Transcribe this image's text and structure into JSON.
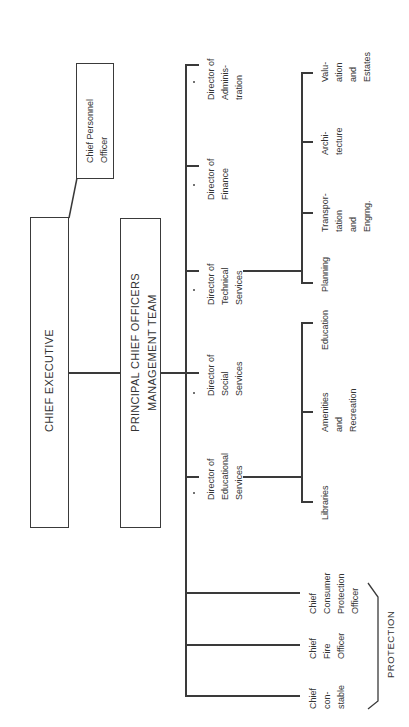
{
  "chart": {
    "orientation": "rotated-90-ccw",
    "top": {
      "chief_executive": "CHIEF EXECUTIVE",
      "chief_personnel_officer": "Chief Personnel\nOfficer",
      "management_team": "PRINCIPAL CHIEF OFFICERS\nMANAGEMENT TEAM"
    },
    "directors": [
      {
        "label": "Director of\nAdminis-\ntration",
        "marked": "*"
      },
      {
        "label": "Director of\nFinance",
        "marked": "*"
      },
      {
        "label": "Director of\nTechnical\nServices",
        "marked": "*"
      },
      {
        "label": "Director of\nSocial\nServices",
        "marked": "*"
      },
      {
        "label": "Director of\nEducational\nServices",
        "marked": "*"
      }
    ],
    "technical_services_units": [
      {
        "label": "Valu-\nation\nand\nEstates"
      },
      {
        "label": "Archi-\ntecture"
      },
      {
        "label": "Transpor-\ntation\nand\nEngrng."
      },
      {
        "label": "Planning"
      }
    ],
    "educational_services_units": [
      {
        "label": "Education"
      },
      {
        "label": "Amenities\nand\nRecreation"
      },
      {
        "label": "Libraries"
      }
    ],
    "protection": {
      "group_label": "PROTECTION",
      "officers": [
        {
          "label": "Chief\nConsumer\nProtection\nOfficer"
        },
        {
          "label": "Chief\nFire\nOfficer"
        },
        {
          "label": "Chief\ncon-\nstable"
        }
      ]
    }
  }
}
